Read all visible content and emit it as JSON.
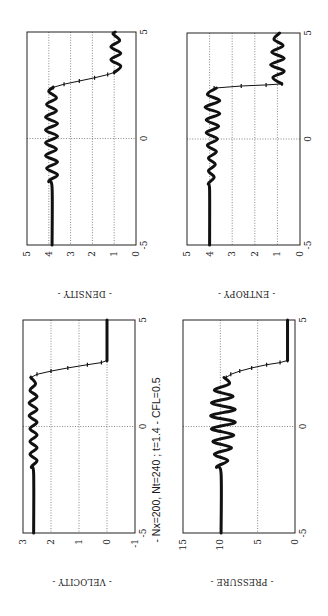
{
  "caption": "- Nx=200, Nt=240 ; t=1.4 - CFL=0.5",
  "chart_data": [
    {
      "type": "line",
      "title": "- DENSITY -",
      "xlabel": "",
      "ylabel": "",
      "xlim": [
        -5,
        5
      ],
      "ylim": [
        0,
        5
      ],
      "xticks": [
        -5,
        0,
        5
      ],
      "yticks": [
        0,
        1,
        2,
        3,
        4,
        5
      ],
      "grid": true,
      "frame": {
        "x": 27,
        "y": 32,
        "w": 109,
        "h": 213
      },
      "series": [
        {
          "name": "density",
          "x": [
            -5,
            -2.3,
            -2.0,
            -1.7,
            -1.4,
            -1.1,
            -0.8,
            -0.5,
            -0.2,
            0.1,
            0.4,
            0.7,
            1.0,
            1.3,
            1.6,
            1.9,
            2.2,
            2.4
          ],
          "y": [
            3.85,
            3.85,
            4.0,
            3.6,
            4.1,
            3.6,
            4.15,
            3.65,
            4.15,
            3.6,
            4.15,
            3.6,
            4.15,
            3.65,
            4.1,
            3.65,
            4.0,
            3.8
          ]
        },
        {
          "name": "density-shock",
          "x": [
            2.4,
            2.55,
            2.7,
            2.85,
            3.0,
            3.1
          ],
          "y": [
            3.8,
            3.3,
            2.6,
            1.9,
            1.3,
            1.0
          ]
        },
        {
          "name": "density-right",
          "x": [
            3.1,
            3.4,
            3.7,
            4.0,
            4.3,
            4.6,
            4.9,
            5.0
          ],
          "y": [
            1.0,
            0.7,
            1.15,
            0.7,
            1.15,
            0.75,
            1.05,
            0.95
          ]
        }
      ]
    },
    {
      "type": "line",
      "title": "- ENTROPY -",
      "xlabel": "",
      "ylabel": "",
      "xlim": [
        -5,
        5
      ],
      "ylim": [
        0,
        5
      ],
      "xticks": [
        -5,
        0,
        5
      ],
      "yticks": [
        0,
        1,
        2,
        3,
        4,
        5
      ],
      "grid": true,
      "frame": {
        "x": 187,
        "y": 33,
        "w": 113,
        "h": 212
      },
      "series": [
        {
          "name": "entropy",
          "x": [
            -5,
            -2.4,
            -2.1,
            -1.8,
            -1.5,
            -1.2,
            -0.9,
            -0.6,
            -0.3,
            0.0,
            0.3,
            0.6,
            0.9,
            1.2,
            1.5,
            1.8,
            2.1,
            2.4
          ],
          "y": [
            4.0,
            4.0,
            4.05,
            3.8,
            4.05,
            3.75,
            4.05,
            3.7,
            4.1,
            3.65,
            4.15,
            3.6,
            4.15,
            3.55,
            4.2,
            3.55,
            4.1,
            3.7
          ]
        },
        {
          "name": "entropy-contact",
          "x": [
            2.4,
            2.5,
            2.55,
            2.6
          ],
          "y": [
            3.8,
            2.6,
            1.5,
            0.8
          ]
        },
        {
          "name": "entropy-right",
          "x": [
            2.6,
            2.9,
            3.2,
            3.5,
            3.8,
            4.1,
            4.4,
            4.7,
            5.0
          ],
          "y": [
            0.8,
            1.2,
            0.7,
            1.3,
            0.7,
            1.25,
            0.75,
            1.15,
            0.9
          ]
        }
      ]
    },
    {
      "type": "line",
      "title": "- VELOCITY -",
      "xlabel": "",
      "ylabel": "",
      "xlim": [
        -5,
        5
      ],
      "ylim": [
        -1,
        3
      ],
      "xticks": [
        -5,
        0,
        5
      ],
      "yticks": [
        -1,
        0,
        1,
        2,
        3
      ],
      "grid": true,
      "frame": {
        "x": 23,
        "y": 320,
        "w": 112,
        "h": 213
      },
      "series": [
        {
          "name": "velocity",
          "x": [
            -5,
            -2.2,
            -1.9,
            -1.6,
            -1.3,
            -1.0,
            -0.7,
            -0.4,
            -0.1,
            0.2,
            0.5,
            0.8,
            1.1,
            1.4,
            1.7,
            2.0,
            2.3
          ],
          "y": [
            2.62,
            2.62,
            2.7,
            2.5,
            2.75,
            2.5,
            2.75,
            2.5,
            2.75,
            2.5,
            2.78,
            2.5,
            2.78,
            2.5,
            2.75,
            2.55,
            2.72
          ]
        },
        {
          "name": "velocity-shock",
          "x": [
            2.3,
            2.45,
            2.6,
            2.75,
            2.9,
            3.0,
            3.1
          ],
          "y": [
            2.72,
            2.5,
            2.0,
            1.4,
            0.7,
            0.2,
            0.0
          ]
        },
        {
          "name": "velocity-right",
          "x": [
            3.1,
            5.0
          ],
          "y": [
            0.0,
            0.0
          ]
        }
      ]
    },
    {
      "type": "line",
      "title": "- PRESSURE -",
      "xlabel": "",
      "ylabel": "",
      "xlim": [
        -5,
        5
      ],
      "ylim": [
        0,
        15
      ],
      "xticks": [
        -5,
        0,
        5
      ],
      "yticks": [
        0,
        5,
        10,
        15
      ],
      "grid": true,
      "frame": {
        "x": 183,
        "y": 320,
        "w": 112,
        "h": 213
      },
      "series": [
        {
          "name": "pressure",
          "x": [
            -5,
            -2.2,
            -1.9,
            -1.6,
            -1.3,
            -1.0,
            -0.7,
            -0.4,
            -0.1,
            0.2,
            0.5,
            0.8,
            1.1,
            1.4,
            1.7,
            2.0,
            2.3
          ],
          "y": [
            9.9,
            9.9,
            10.5,
            9.0,
            10.8,
            8.5,
            11.0,
            8.2,
            11.2,
            8.0,
            11.3,
            8.0,
            11.2,
            8.3,
            10.8,
            8.8,
            9.5
          ]
        },
        {
          "name": "pressure-shock",
          "x": [
            2.3,
            2.45,
            2.6,
            2.75,
            2.9,
            3.0,
            3.1
          ],
          "y": [
            9.2,
            8.6,
            7.4,
            5.8,
            3.8,
            2.0,
            1.0
          ]
        },
        {
          "name": "pressure-right",
          "x": [
            3.1,
            5.0
          ],
          "y": [
            1.0,
            1.0
          ]
        }
      ]
    }
  ]
}
